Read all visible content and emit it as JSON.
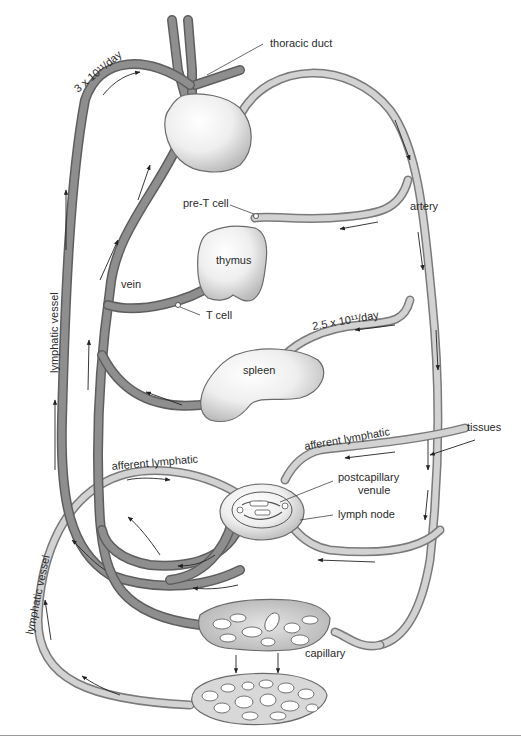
{
  "diagram": {
    "colors": {
      "vein_outline": "#5e5e5e",
      "vein_fill": "#8e8e8e",
      "artery_outline": "#7a7a7a",
      "artery_fill": "#d2d2d2",
      "organ_fill_light": "#ffffff",
      "organ_fill_dark": "#bdbdbd",
      "text": "#2a2a2a",
      "background": "#ffffff"
    },
    "labels": {
      "thoracic_duct": "thoracic duct",
      "flow_rate_lymph": "3 x 10¹¹/day",
      "pre_t_cell": "pre-T cell",
      "artery": "artery",
      "thymus": "thymus",
      "vein": "vein",
      "t_cell": "T cell",
      "flow_rate_spleen": "2.5 x 10¹¹/day",
      "lymphatic_vessel_upper": "lymphatic vessel",
      "spleen": "spleen",
      "tissues": "tissues",
      "afferent_lymphatic_right": "afferent lymphatic",
      "afferent_lymphatic_left": "afferent lymphatic",
      "postcapillary_venule_line1": "postcapillary",
      "postcapillary_venule_line2": "venule",
      "lymph_node": "lymph node",
      "lymphatic_vessel_lower": "lymphatic vessel",
      "capillary": "capillary"
    },
    "structures": [
      "heart",
      "thymus",
      "spleen",
      "lymph node",
      "capillary bed",
      "tissue lymphatic bed"
    ],
    "vessels": [
      "thoracic duct",
      "lymphatic vessel",
      "vein",
      "artery",
      "afferent lymphatic",
      "postcapillary venule"
    ]
  }
}
